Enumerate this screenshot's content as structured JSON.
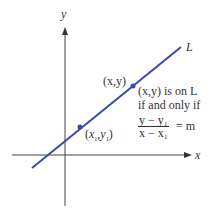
{
  "axes": {
    "x_label": "x",
    "y_label": "y",
    "axis_color": "#444444"
  },
  "line": {
    "label": "L",
    "color": "#3b4aa8"
  },
  "points": [
    {
      "label": "(x₁,y₁)",
      "x_sym": "x",
      "x_sub": "1",
      "y_sym": "y",
      "y_sub": "1"
    },
    {
      "label": "(x,y)"
    }
  ],
  "annotation": {
    "line1": "(x,y) is on L",
    "line2": "if and only if",
    "fraction_numerator": "y − y₁",
    "fraction_denominator": "x − x₁",
    "equals": "= m"
  }
}
